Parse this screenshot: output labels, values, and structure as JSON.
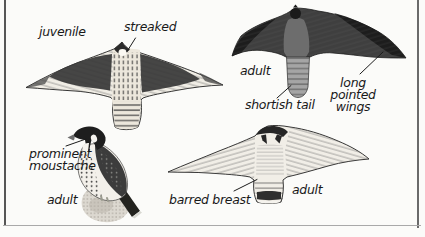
{
  "figure": {
    "annotations": {
      "juvenile": "juvenile",
      "streaked": "streaked",
      "adult_upperside": "adult",
      "shortish_tail": "shortish tail",
      "long_pointed_wings": "long\npointed\nwings",
      "prominent_moustache": "prominent\nmoustache",
      "adult_perched": "adult",
      "barred_breast": "barred breast",
      "adult_underside": "adult"
    },
    "colors": {
      "ink": "#1c1c1c",
      "dark_plumage": "#2e2e2e",
      "mid_gray": "#6f6f6f",
      "pale_plumage": "#f0ede5",
      "page_background": "#fbfbf9",
      "rule_gray": "#565656"
    }
  }
}
